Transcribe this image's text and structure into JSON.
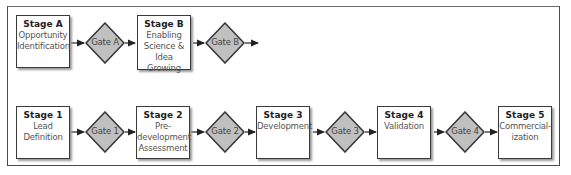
{
  "diagram": {
    "type": "stage-gate-process",
    "colors": {
      "frame": "#4a4a4a",
      "stage_fill": "#ffffff",
      "stage_border": "#3a3a3a",
      "gate_fill": "#c0c0c0",
      "gate_border": "#333333",
      "arrow": "#222222",
      "title_text": "#222222",
      "desc_text": "#555555"
    },
    "rows": [
      {
        "name": "discovery-row",
        "stages": [
          {
            "title": "Stage A",
            "desc": [
              "Opportunity",
              "Identification"
            ]
          },
          {
            "title": "Stage B",
            "desc": [
              "Enabling",
              "Science &",
              "Idea Growing"
            ]
          }
        ],
        "gates": [
          {
            "label": "Gate A"
          },
          {
            "label": "Gate B"
          }
        ]
      },
      {
        "name": "development-row",
        "stages": [
          {
            "title": "Stage 1",
            "desc": [
              "Lead",
              "Definition"
            ]
          },
          {
            "title": "Stage 2",
            "desc": [
              "Pre-",
              "development",
              "Assessment"
            ]
          },
          {
            "title": "Stage 3",
            "desc": [
              "Development"
            ]
          },
          {
            "title": "Stage 4",
            "desc": [
              "Validation"
            ]
          },
          {
            "title": "Stage 5",
            "desc": [
              "Commercial-",
              "ization"
            ]
          }
        ],
        "gates": [
          {
            "label": "Gate 1"
          },
          {
            "label": "Gate 2"
          },
          {
            "label": "Gate 3"
          },
          {
            "label": "Gate 4"
          }
        ]
      }
    ]
  }
}
